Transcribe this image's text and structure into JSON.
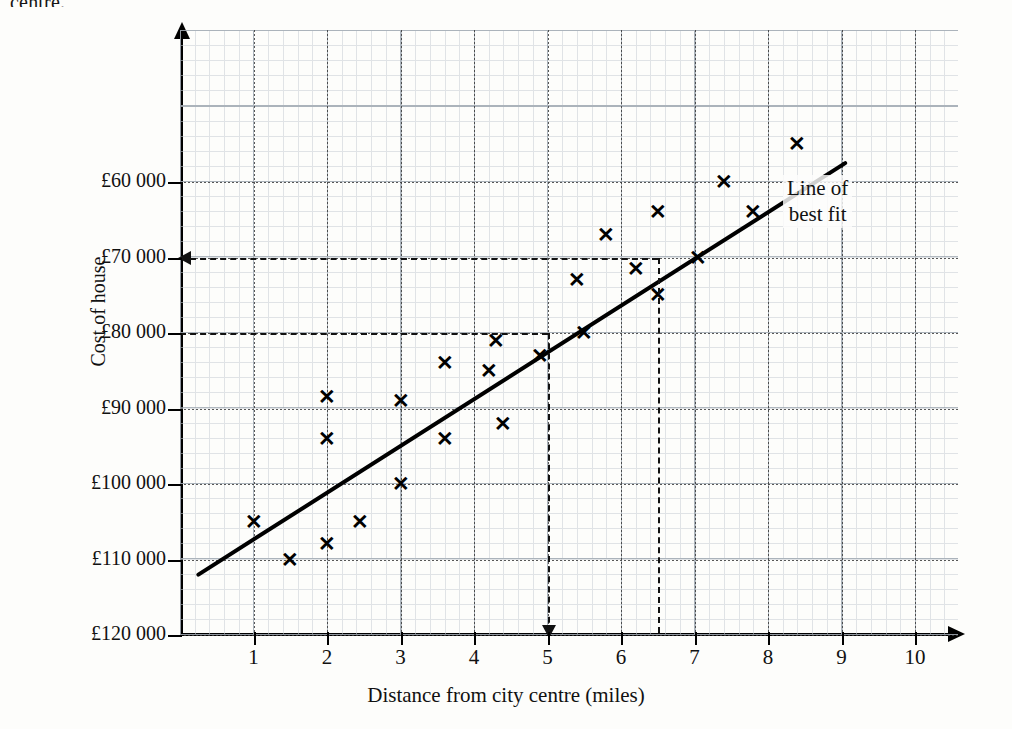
{
  "page": {
    "cut_off_heading": "centre.",
    "background_color": "#fdfdfb",
    "ink_color": "#111111"
  },
  "annotations": [
    {
      "name": "line-of-best-fit-label",
      "text": "Line of\nbest fit",
      "x_px": 838,
      "y_px": 193
    }
  ],
  "axes": {
    "y": {
      "title": "Cost of house",
      "tick_labels": [
        "£60 000",
        "£70 000",
        "£80 000",
        "£90 000",
        "£100 000",
        "£110 000",
        "£120 000"
      ],
      "tick_values": [
        60000,
        70000,
        80000,
        90000,
        100000,
        110000,
        120000
      ],
      "inverted": true,
      "min": 60000,
      "max": 120000
    },
    "x": {
      "title": "Distance from city centre (miles)",
      "tick_labels": [
        "1",
        "2",
        "3",
        "4",
        "5",
        "6",
        "7",
        "8",
        "9",
        "10"
      ],
      "tick_values": [
        1,
        2,
        3,
        4,
        5,
        6,
        7,
        8,
        9,
        10
      ],
      "min": 0,
      "max": 10.5
    }
  },
  "construction_lines": [
    {
      "name": "read-off-at-5-miles",
      "x_value": 5,
      "y_value": 80000,
      "has_arrow_on_x": true,
      "has_arrow_on_y": false,
      "style": "dashed"
    },
    {
      "name": "read-off-at-6.5-miles",
      "x_value": 6.5,
      "y_value": 70000,
      "has_arrow_on_x": false,
      "has_arrow_on_y": true,
      "style": "dashed"
    }
  ],
  "chart_data": {
    "type": "scatter",
    "title": "",
    "xlabel": "Distance from city centre (miles)",
    "ylabel": "Cost of house",
    "xlim": [
      0,
      10.5
    ],
    "ylim": [
      120000,
      55000
    ],
    "y_axis_inverted": true,
    "grid": true,
    "legend": false,
    "marker": "x",
    "marker_color": "#000000",
    "points": [
      {
        "x": 1.0,
        "y": 105000
      },
      {
        "x": 1.5,
        "y": 110000
      },
      {
        "x": 2.0,
        "y": 108000
      },
      {
        "x": 2.0,
        "y": 94000
      },
      {
        "x": 2.0,
        "y": 88500
      },
      {
        "x": 2.45,
        "y": 105000
      },
      {
        "x": 3.0,
        "y": 100000
      },
      {
        "x": 3.0,
        "y": 89000
      },
      {
        "x": 3.6,
        "y": 94000
      },
      {
        "x": 3.6,
        "y": 84000
      },
      {
        "x": 4.2,
        "y": 85000
      },
      {
        "x": 4.3,
        "y": 81000
      },
      {
        "x": 4.4,
        "y": 92000
      },
      {
        "x": 4.9,
        "y": 83000
      },
      {
        "x": 5.4,
        "y": 73000
      },
      {
        "x": 5.5,
        "y": 80000
      },
      {
        "x": 5.8,
        "y": 67000
      },
      {
        "x": 6.2,
        "y": 71500
      },
      {
        "x": 6.5,
        "y": 64000
      },
      {
        "x": 6.5,
        "y": 75000
      },
      {
        "x": 7.05,
        "y": 70000
      },
      {
        "x": 7.4,
        "y": 60000
      },
      {
        "x": 7.8,
        "y": 64000
      },
      {
        "x": 8.4,
        "y": 55000
      }
    ],
    "best_fit_line": {
      "name": "Line of best fit",
      "x_start": 0.25,
      "y_start": 112000,
      "x_end": 9.05,
      "y_end": 57500
    }
  }
}
